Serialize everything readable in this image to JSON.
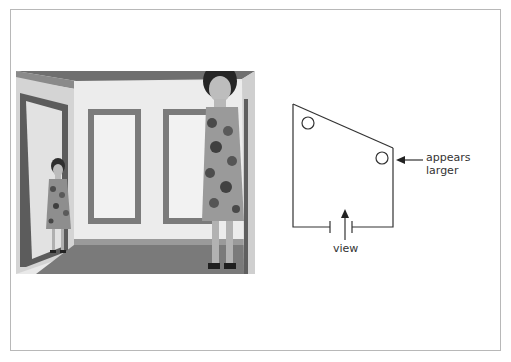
{
  "figure": {
    "photo": {
      "description": "Ames room photograph: two women in floral dresses, one appearing small in the left corner, one appearing large in the right corner",
      "alt": "Ames room illusion photograph"
    },
    "diagram": {
      "labels": {
        "appears_line1": "appears",
        "appears_line2": "larger",
        "view": "view"
      },
      "icons": [
        "arrow-left-icon",
        "arrow-up-icon"
      ]
    }
  },
  "colors": {
    "frame_border": "#b8b8b8",
    "diagram_line": "#333333",
    "background": "#ffffff"
  }
}
